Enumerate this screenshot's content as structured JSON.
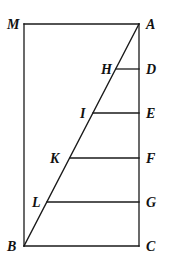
{
  "diagram": {
    "type": "geometric-figure",
    "colors": {
      "stroke": "#1a1a1a",
      "label": "#111111",
      "background": "#ffffff"
    },
    "points": {
      "M": {
        "label": "M",
        "x": 24,
        "y": 24
      },
      "A": {
        "label": "A",
        "x": 139,
        "y": 24
      },
      "B": {
        "label": "B",
        "x": 24,
        "y": 246
      },
      "C": {
        "label": "C",
        "x": 139,
        "y": 246
      },
      "H": {
        "label": "H",
        "x": 116,
        "y": 69
      },
      "D": {
        "label": "D",
        "x": 139,
        "y": 69
      },
      "I": {
        "label": "I",
        "x": 93,
        "y": 113
      },
      "E": {
        "label": "E",
        "x": 139,
        "y": 113
      },
      "K": {
        "label": "K",
        "x": 70,
        "y": 158
      },
      "F": {
        "label": "F",
        "x": 139,
        "y": 158
      },
      "L": {
        "label": "L",
        "x": 47,
        "y": 202
      },
      "G": {
        "label": "G",
        "x": 139,
        "y": 202
      }
    },
    "segments": [
      [
        "M",
        "A"
      ],
      [
        "A",
        "C"
      ],
      [
        "C",
        "B"
      ],
      [
        "B",
        "M"
      ],
      [
        "A",
        "B"
      ],
      [
        "H",
        "D"
      ],
      [
        "I",
        "E"
      ],
      [
        "K",
        "F"
      ],
      [
        "L",
        "G"
      ]
    ],
    "labels": {
      "M": "M",
      "A": "A",
      "B": "B",
      "C": "C",
      "D": "D",
      "E": "E",
      "F": "F",
      "G": "G",
      "H": "H",
      "I": "I",
      "K": "K",
      "L": "L"
    }
  }
}
